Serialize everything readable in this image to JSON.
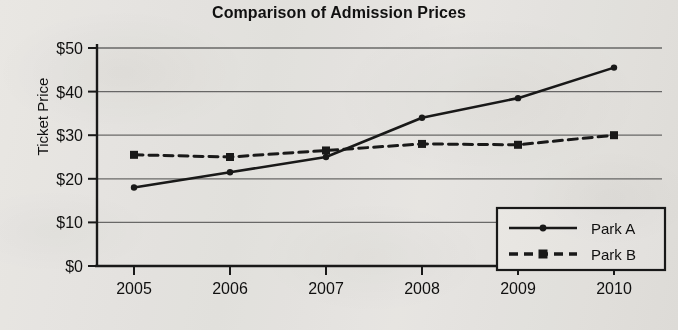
{
  "chart_data": {
    "type": "line",
    "title": "Comparison of Admission Prices",
    "xlabel": "",
    "ylabel": "Ticket Price",
    "categories": [
      "2005",
      "2006",
      "2007",
      "2008",
      "2009",
      "2010"
    ],
    "x": [
      2005,
      2006,
      2007,
      2008,
      2009,
      2010
    ],
    "series": [
      {
        "name": "Park A",
        "values": [
          18,
          21.5,
          25,
          34,
          38.5,
          45.5
        ],
        "line_style": "solid",
        "marker": "circle",
        "color": "#000000"
      },
      {
        "name": "Park B",
        "values": [
          25.5,
          25,
          26.5,
          28,
          27.8,
          30
        ],
        "line_style": "dashed",
        "marker": "square",
        "color": "#000000"
      }
    ],
    "ylim": [
      0,
      50
    ],
    "ytick_values": [
      0,
      10,
      20,
      30,
      40,
      50
    ],
    "ytick_labels": [
      "$0",
      "$10",
      "$20",
      "$30",
      "$40",
      "$50"
    ],
    "grid": "horizontal",
    "legend_position": "lower-right"
  },
  "legend": {
    "entries": [
      {
        "label": "Park A"
      },
      {
        "label": "Park B"
      }
    ]
  },
  "colors": {
    "ink": "#1a1a1a",
    "grid": "#6f6f6f",
    "paper": "#f2f1ef"
  }
}
